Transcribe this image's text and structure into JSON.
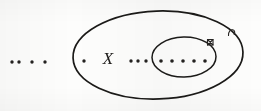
{
  "figure": {
    "kind": "venn-style nested ellipse diagram",
    "background_color": "#fdfdfc",
    "ink_color": "#1b1a18",
    "outer_set": {
      "label": "X",
      "label_x": 108,
      "label_y": 58,
      "cx": 158,
      "cy": 55,
      "rx": 85,
      "ry": 44,
      "rotation": -2,
      "stroke_width": 1.7
    },
    "inner_set": {
      "label": "",
      "cx": 184,
      "cy": 57,
      "rx": 32,
      "ry": 20,
      "rotation": -1,
      "stroke_width": 1.5
    },
    "dot_rows": [
      {
        "name": "dots-outside-left",
        "region": "outside both ellipses, to the left",
        "y": 62,
        "radius": 1.7,
        "x_positions": [
          12,
          19,
          32,
          45
        ]
      },
      {
        "name": "dot-inside-outer-left",
        "region": "inside outer ellipse, left of label X",
        "y": 61,
        "radius": 1.7,
        "x_positions": [
          84
        ]
      },
      {
        "name": "dots-between-label-and-inner",
        "region": "inside outer ellipse, right of label X, outside inner ellipse",
        "y": 61,
        "radius": 1.7,
        "x_positions": [
          131,
          138,
          146
        ]
      },
      {
        "name": "dots-inside-inner",
        "region": "inside the inner ellipse",
        "y": 61,
        "radius": 1.8,
        "x_positions": [
          161,
          172,
          183,
          194,
          205
        ]
      }
    ],
    "marks": [
      {
        "name": "mark-inner-boundary",
        "description": "small square tick glyph on the upper-right boundary of the inner ellipse",
        "x": 210,
        "y": 42,
        "size": 6
      },
      {
        "name": "mark-outer-boundary",
        "description": "small hook tick glyph on the upper-right boundary of the outer ellipse",
        "x": 231,
        "y": 32,
        "size": 7
      }
    ]
  }
}
